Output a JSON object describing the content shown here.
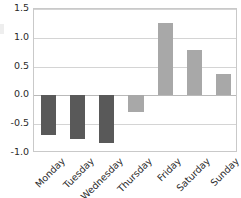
{
  "chart_data": {
    "type": "bar",
    "title": "",
    "xlabel": "",
    "ylabel": "",
    "categories": [
      "Monday",
      "Tuesday",
      "Wednesday",
      "Thursday",
      "Friday",
      "Saturday",
      "Sunday"
    ],
    "values": [
      -0.68,
      -0.75,
      -0.82,
      -0.28,
      1.25,
      0.79,
      0.37
    ],
    "bar_colors": [
      "#595959",
      "#595959",
      "#595959",
      "#a8a8a8",
      "#a8a8a8",
      "#a8a8a8",
      "#a8a8a8"
    ],
    "ylim": [
      -1.0,
      1.5
    ],
    "yticks": [
      1.5,
      1.0,
      0.5,
      0.0,
      -0.5,
      -1.0
    ],
    "ytick_labels": [
      "1.5",
      "1.0",
      "0.5",
      "0.0",
      "-0.5",
      "-1.0"
    ],
    "grid": true,
    "grid_axis": "y",
    "legend": false,
    "xtick_rotation": -45,
    "zero_line": 0.0
  },
  "style": {
    "background": "#ffffff",
    "grid_color": "#d4d4d4",
    "axis_color": "#c9c9c9",
    "zero_line_color": "#b9b9b9",
    "tick_label_color": "#2b2b2b",
    "bar_color_negative_group": "#595959",
    "bar_color_positive_group": "#a8a8a8"
  }
}
